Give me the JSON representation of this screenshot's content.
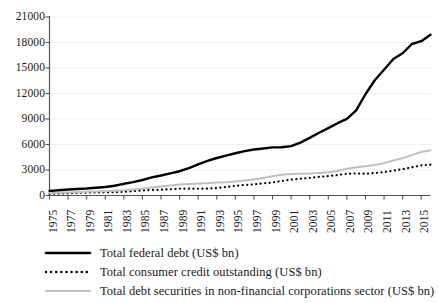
{
  "chart_data": {
    "type": "line",
    "title": "",
    "subtitle": "",
    "xlabel": "",
    "ylabel": "",
    "grid": true,
    "legend_position": "bottom",
    "xlim": [
      1975,
      2016
    ],
    "ylim": [
      0,
      21000
    ],
    "yticks": [
      0,
      3000,
      6000,
      9000,
      12000,
      15000,
      18000,
      21000
    ],
    "ytick_labels": [
      "0",
      "3000",
      "6000",
      "9000",
      "12000",
      "15000",
      "18000",
      "21000"
    ],
    "xticks": [
      1975,
      1977,
      1979,
      1981,
      1983,
      1985,
      1987,
      1989,
      1991,
      1993,
      1995,
      1997,
      1999,
      2001,
      2003,
      2005,
      2007,
      2009,
      2011,
      2013,
      2015
    ],
    "xtick_labels": [
      "1975",
      "1977",
      "1979",
      "1981",
      "1983",
      "1985",
      "1987",
      "1989",
      "1991",
      "1993",
      "1995",
      "1997",
      "1999",
      "2001",
      "2003",
      "2005",
      "2007",
      "2009",
      "2011",
      "2013",
      "2015"
    ],
    "x": [
      1975,
      1976,
      1977,
      1978,
      1979,
      1980,
      1981,
      1982,
      1983,
      1984,
      1985,
      1986,
      1987,
      1988,
      1989,
      1990,
      1991,
      1992,
      1993,
      1994,
      1995,
      1996,
      1997,
      1998,
      1999,
      2000,
      2001,
      2002,
      2003,
      2004,
      2005,
      2006,
      2007,
      2008,
      2009,
      2010,
      2011,
      2012,
      2013,
      2014,
      2015,
      2016
    ],
    "series": [
      {
        "name": "Total federal debt (US$ bn)",
        "style": "solid-thick",
        "color": "#000000",
        "values": [
          533,
          620,
          699,
          772,
          827,
          908,
          998,
          1142,
          1377,
          1573,
          1823,
          2125,
          2350,
          2602,
          2857,
          3233,
          3665,
          4065,
          4411,
          4693,
          4974,
          5225,
          5413,
          5526,
          5656,
          5674,
          5807,
          6228,
          6783,
          7379,
          7933,
          8507,
          9008,
          10025,
          11910,
          13562,
          14790,
          16066,
          16738,
          17824,
          18151,
          18920
        ]
      },
      {
        "name": "Total consumer credit outstanding (US$ bn)",
        "style": "dotted",
        "color": "#000000",
        "values": [
          204,
          226,
          261,
          306,
          348,
          352,
          372,
          385,
          434,
          514,
          593,
          646,
          684,
          733,
          795,
          809,
          796,
          806,
          866,
          1001,
          1141,
          1242,
          1311,
          1421,
          1532,
          1718,
          1867,
          1972,
          2077,
          2192,
          2291,
          2417,
          2551,
          2594,
          2554,
          2647,
          2755,
          2923,
          3098,
          3318,
          3537,
          3640
        ]
      },
      {
        "name": "Total debt securities in non-financial corporations sector (US$ bn)",
        "style": "solid-thin-gray",
        "color": "#bfbfbf",
        "values": [
          300,
          325,
          355,
          390,
          428,
          468,
          512,
          560,
          614,
          700,
          810,
          950,
          1060,
          1180,
          1280,
          1345,
          1400,
          1452,
          1520,
          1570,
          1660,
          1760,
          1880,
          2070,
          2280,
          2430,
          2540,
          2560,
          2600,
          2660,
          2730,
          2880,
          3140,
          3330,
          3450,
          3600,
          3810,
          4110,
          4400,
          4750,
          5130,
          5310
        ]
      }
    ]
  },
  "legend": {
    "items": [
      {
        "label": "Total federal debt (US$ bn)",
        "swatch": "solid-thick-black"
      },
      {
        "label": "Total consumer credit outstanding (US$ bn)",
        "swatch": "dotted-black"
      },
      {
        "label": "Total debt securities in non-financial corporations sector (US$ bn)",
        "swatch": "solid-thin-gray"
      }
    ]
  },
  "axis": {
    "axis_color": "#555555",
    "grid_color": "#f0f0f0"
  }
}
